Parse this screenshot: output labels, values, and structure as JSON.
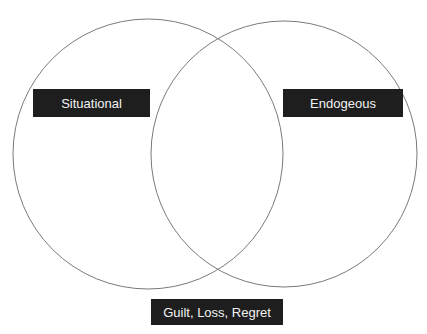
{
  "diagram": {
    "type": "venn",
    "circles": [
      {
        "id": "left",
        "cx": 148,
        "cy": 154,
        "r": 135,
        "stroke": "#7a7a7a"
      },
      {
        "id": "right",
        "cx": 284,
        "cy": 154,
        "r": 133,
        "stroke": "#7a7a7a"
      }
    ],
    "labels": {
      "left": "Situational",
      "right": "Endogeous",
      "intersection": "Guilt, Loss, Regret"
    },
    "colors": {
      "label_background": "#1e1e1e",
      "label_text": "#f2f2f2",
      "circle_stroke": "#7a7a7a",
      "background": "#ffffff"
    }
  }
}
